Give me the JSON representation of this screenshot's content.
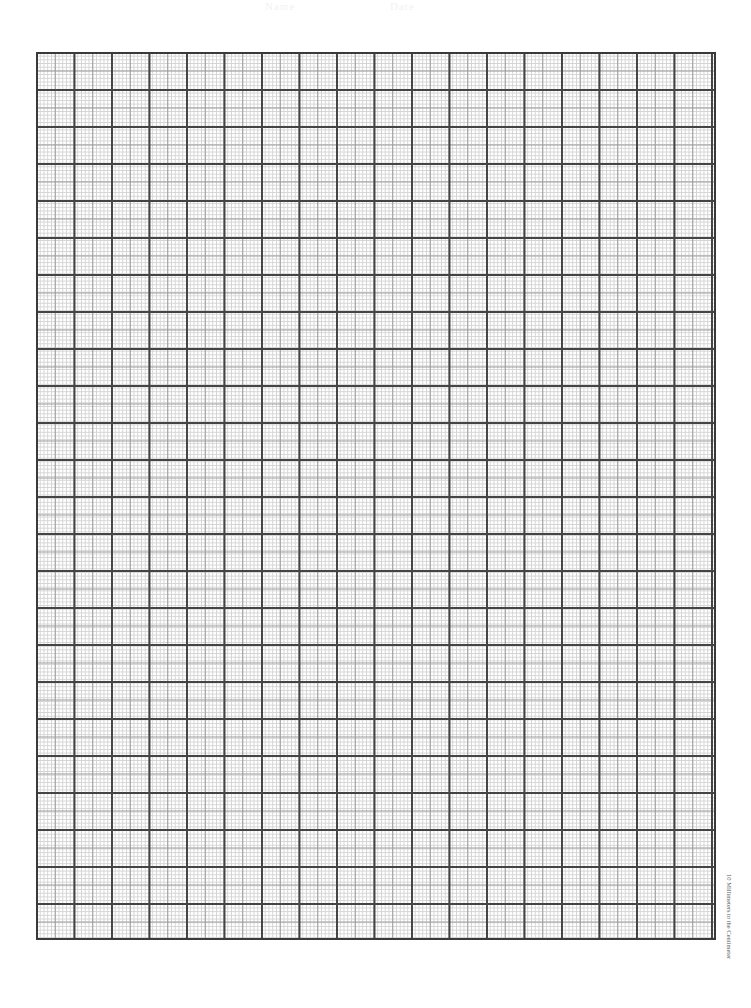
{
  "header": {
    "name_label": "Name",
    "date_label": "Date"
  },
  "grid": {
    "major_columns": 18,
    "major_rows": 24,
    "subdivisions_per_major": 10,
    "major_line_color": "#444444",
    "half_line_color": "#9a9a9a",
    "minor_line_color": "#d4d4d4"
  },
  "side_label": "10 Millimeters to the Centimeter"
}
